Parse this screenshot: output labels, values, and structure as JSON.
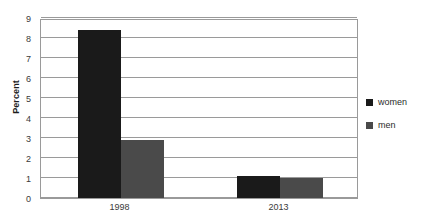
{
  "chart_data": {
    "type": "bar",
    "title": "",
    "subtitle": "",
    "xlabel": "",
    "ylabel": "Percent",
    "categories": [
      "1998",
      "2013"
    ],
    "series": [
      {
        "name": "women",
        "color": "#1a1a1a",
        "values": [
          8.4,
          1.1
        ]
      },
      {
        "name": "men",
        "color": "#4a4a4a",
        "values": [
          2.9,
          1.0
        ]
      }
    ],
    "ylim": [
      0,
      9
    ],
    "ytick_labels": [
      "0",
      "1",
      "2",
      "3",
      "4",
      "5",
      "6",
      "7",
      "8",
      "9"
    ],
    "ytick_values": [
      0,
      1,
      2,
      3,
      4,
      5,
      6,
      7,
      8,
      9
    ],
    "grid": true,
    "grid_axis": "y",
    "legend_position": "right",
    "legend": [
      {
        "label": "women",
        "color": "#1a1a1a"
      },
      {
        "label": "men",
        "color": "#4a4a4a"
      }
    ],
    "plot_background": "#ffffff",
    "axis_color": "#9a9a9a"
  }
}
